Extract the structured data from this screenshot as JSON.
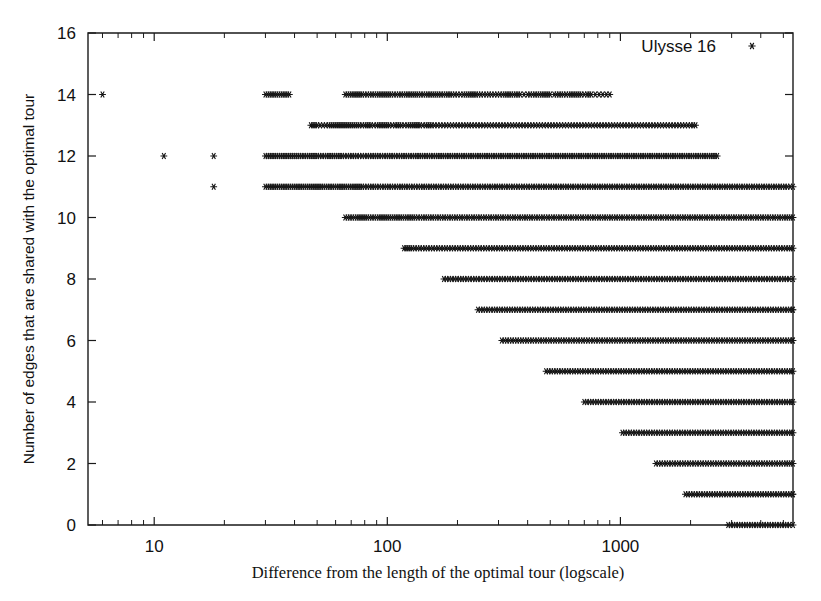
{
  "figure": {
    "background": "#ffffff",
    "ink_color": "#161616",
    "width": 821,
    "height": 601
  },
  "legend": {
    "label": "Ulysse 16",
    "marker": "asterisk-marker",
    "position": "top-right-inside"
  },
  "axes": {
    "x": {
      "title": "Difference from the length of the optimal tour (logscale)",
      "scale": "log",
      "tick_labels": [
        "10",
        "100",
        "1000"
      ],
      "tick_values": [
        10,
        100,
        1000
      ],
      "range": [
        5.2,
        5500
      ]
    },
    "y": {
      "title": "Number of edges that are shared with the optimal tour",
      "scale": "linear",
      "tick_labels": [
        "0",
        "2",
        "4",
        "6",
        "8",
        "10",
        "12",
        "14",
        "16"
      ],
      "tick_values": [
        0,
        2,
        4,
        6,
        8,
        10,
        12,
        14,
        16
      ],
      "range": [
        0,
        16
      ]
    }
  },
  "chart_data": {
    "type": "scatter",
    "title": "",
    "xlabel": "Difference from the length of the optimal tour (logscale)",
    "ylabel": "Number of edges that are shared with the optimal tour",
    "xscale": "log",
    "xlim": [
      5.2,
      5500
    ],
    "ylim": [
      0,
      16
    ],
    "grid": false,
    "legend": [
      "Ulysse 16"
    ],
    "legend_position": "upper right",
    "marker": "asterisk",
    "series": [
      {
        "name": "Ulysse 16",
        "rows": [
          {
            "y": 14,
            "x_min": 6.0,
            "x_max": 900,
            "x": [
              6.0,
              30,
              38,
              66,
              72,
              78,
              84,
              90,
              96,
              104,
              112,
              120,
              128,
              136,
              146,
              156,
              166,
              178,
              190,
              200,
              212,
              226,
              240,
              252,
              266,
              280,
              296,
              312,
              326,
              340,
              356,
              372,
              386,
              400,
              420,
              440,
              460,
              480,
              500,
              520,
              545,
              570,
              600,
              640,
              680,
              700,
              720,
              750,
              780,
              810,
              840,
              870,
              900
            ]
          },
          {
            "y": 13,
            "x_min": 47,
            "x_max": 2100,
            "x": [
              47,
              50,
              53,
              56,
              76,
              80,
              85,
              90,
              96,
              102,
              108,
              115,
              122,
              130,
              138,
              146,
              155,
              164,
              174,
              184,
              195,
              206,
              218,
              230,
              244,
              258,
              273,
              289,
              306,
              324,
              343,
              363,
              384,
              407,
              431,
              456,
              483,
              511,
              541,
              573,
              607,
              642,
              680,
              720,
              762,
              807,
              854,
              904,
              957,
              1013,
              1072,
              1135,
              1201,
              1272,
              1346,
              1425,
              1508,
              1596,
              1690,
              1789,
              1893,
              2004,
              2100
            ]
          },
          {
            "y": 12,
            "x_min": 11,
            "x_max": 2600,
            "x": [
              11,
              18,
              30,
              38,
              42,
              46,
              50,
              55,
              64,
              69,
              74,
              80,
              86,
              92,
              99,
              106,
              114,
              122,
              131,
              140,
              150,
              161,
              172,
              184,
              197,
              211,
              226,
              242,
              259,
              277,
              297,
              318,
              340,
              364,
              390,
              417,
              446,
              478,
              511,
              547,
              586,
              627,
              671,
              718,
              769,
              823,
              881,
              943,
              1009,
              1080,
              1156,
              1237,
              1324,
              1417,
              1517,
              1624,
              1738,
              1860,
              1991,
              2131,
              2281,
              2441,
              2600
            ]
          },
          {
            "y": 11,
            "x_min": 18,
            "x_max": 5500,
            "x": [
              18,
              30,
              38,
              46,
              52,
              58,
              62,
              66,
              72,
              78,
              84,
              90,
              97,
              104,
              112,
              120,
              129,
              139,
              149,
              160,
              172,
              185,
              199,
              214,
              230,
              247,
              266,
              286,
              307,
              330,
              355,
              382,
              411,
              442,
              475,
              511,
              549,
              590,
              634,
              682,
              733,
              788,
              847,
              911,
              979,
              1053,
              1132,
              1217,
              1308,
              1407,
              1513,
              1627,
              1749,
              1881,
              2023,
              2175,
              2339,
              2515,
              2705,
              2909,
              3128,
              3364,
              3618,
              3891,
              4184,
              4500,
              4840,
              5200,
              5500
            ]
          },
          {
            "y": 10,
            "x_min": 66,
            "x_max": 5500,
            "x": [
              66,
              74,
              82,
              92,
              102,
              116,
              124,
              132,
              142,
              152,
              163,
              175,
              188,
              202,
              217,
              233,
              250,
              269,
              289,
              310,
              333,
              358,
              385,
              413,
              444,
              477,
              513,
              551,
              592,
              636,
              684,
              735,
              790,
              849,
              912,
              980,
              1053,
              1132,
              1216,
              1307,
              1405,
              1510,
              1623,
              1744,
              1874,
              2014,
              2165,
              2327,
              2501,
              2688,
              2889,
              3105,
              3337,
              3587,
              3855,
              4143,
              4453,
              4786,
              5143,
              5500
            ]
          },
          {
            "y": 9,
            "x_min": 118,
            "x_max": 5500,
            "x": [
              118,
              128,
              138,
              149,
              161,
              174,
              188,
              203,
              219,
              237,
              256,
              277,
              299,
              323,
              349,
              377,
              407,
              440,
              475,
              513,
              554,
              599,
              647,
              699,
              755,
              816,
              882,
              953,
              1030,
              1113,
              1203,
              1300,
              1405,
              1518,
              1641,
              1773,
              1916,
              2071,
              2238,
              2419,
              2614,
              2825,
              3053,
              3300,
              3566,
              3854,
              4165,
              4501,
              4864,
              5256,
              5500
            ]
          },
          {
            "y": 8,
            "x_min": 175,
            "x_max": 5500,
            "x": [
              175,
              189,
              204,
              220,
              238,
              257,
              278,
              300,
              324,
              350,
              378,
              409,
              442,
              477,
              516,
              557,
              602,
              651,
              703,
              760,
              821,
              887,
              959,
              1036,
              1120,
              1210,
              1308,
              1414,
              1528,
              1651,
              1785,
              1929,
              2085,
              2253,
              2435,
              2632,
              2845,
              3075,
              3324,
              3593,
              3883,
              4197,
              4537,
              4903,
              5300,
              5500
            ]
          },
          {
            "y": 7,
            "x_min": 245,
            "x_max": 5500,
            "x": [
              245,
              264,
              285,
              307,
              331,
              357,
              385,
              415,
              448,
              483,
              521,
              562,
              606,
              654,
              705,
              761,
              821,
              886,
              955,
              1031,
              1112,
              1200,
              1294,
              1396,
              1506,
              1625,
              1753,
              1891,
              2040,
              2201,
              2374,
              2561,
              2763,
              2981,
              3216,
              3469,
              3742,
              4037,
              4355,
              4698,
              5068,
              5466,
              5500
            ]
          },
          {
            "y": 6,
            "x_min": 310,
            "x_max": 5500,
            "x": [
              310,
              334,
              360,
              388,
              418,
              451,
              486,
              524,
              565,
              609,
              657,
              708,
              764,
              824,
              888,
              958,
              1033,
              1114,
              1201,
              1295,
              1397,
              1507,
              1625,
              1753,
              1891,
              2039,
              2200,
              2373,
              2560,
              2761,
              2978,
              3213,
              3466,
              3739,
              4034,
              4352,
              4695,
              5065,
              5464,
              5500
            ]
          },
          {
            "y": 5,
            "x_min": 480,
            "x_max": 5500,
            "x": [
              480,
              517,
              557,
              601,
              648,
              699,
              754,
              813,
              877,
              946,
              1020,
              1100,
              1187,
              1280,
              1381,
              1489,
              1606,
              1732,
              1869,
              2016,
              2174,
              2345,
              2530,
              2729,
              2944,
              3175,
              3425,
              3695,
              3986,
              4300,
              4638,
              5003,
              5396,
              5500
            ]
          },
          {
            "y": 4,
            "x_min": 700,
            "x_max": 5500,
            "x": [
              700,
              755,
              814,
              878,
              947,
              1022,
              1102,
              1189,
              1282,
              1383,
              1492,
              1609,
              1736,
              1872,
              2019,
              2178,
              2349,
              2534,
              2733,
              2948,
              3180,
              3430,
              3700,
              3991,
              4305,
              4643,
              5008,
              5400,
              5500
            ]
          },
          {
            "y": 3,
            "x_min": 1020,
            "x_max": 5500,
            "x": [
              1020,
              1100,
              1187,
              1280,
              1381,
              1490,
              1607,
              1733,
              1869,
              2016,
              2175,
              2346,
              2530,
              2729,
              2944,
              3175,
              3425,
              3694,
              3985,
              4298,
              4636,
              5000,
              5392,
              5500
            ]
          },
          {
            "y": 2,
            "x_min": 1420,
            "x_max": 5500,
            "x": [
              1420,
              1532,
              1652,
              1782,
              1922,
              2073,
              2236,
              2412,
              2601,
              2806,
              3026,
              3264,
              3520,
              3797,
              4095,
              4417,
              4764,
              5138,
              5500
            ]
          },
          {
            "y": 1,
            "x_min": 1900,
            "x_max": 5500,
            "x": [
              1900,
              2049,
              2210,
              2384,
              2571,
              2773,
              2991,
              3226,
              3479,
              3752,
              4047,
              4365,
              4708,
              5078,
              5476,
              5500
            ]
          },
          {
            "y": 0,
            "x_min": 2900,
            "x_max": 5500,
            "x": [
              2900,
              3128,
              3373,
              3638,
              3924,
              4232,
              4565,
              4923,
              5310,
              5500
            ]
          }
        ]
      }
    ]
  }
}
